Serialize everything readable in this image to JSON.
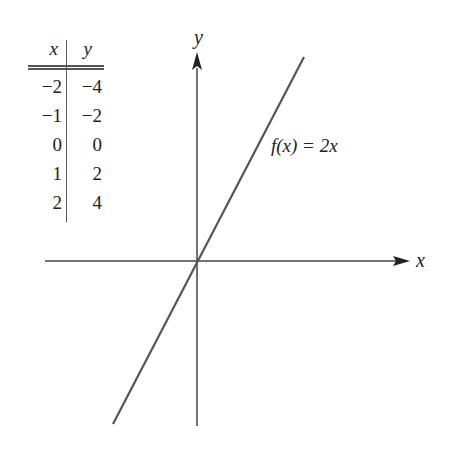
{
  "table": {
    "headers": {
      "x": "x",
      "y": "y"
    },
    "rows": [
      {
        "x": "−2",
        "y": "−4"
      },
      {
        "x": "−1",
        "y": "−2"
      },
      {
        "x": "0",
        "y": "0"
      },
      {
        "x": "1",
        "y": "2"
      },
      {
        "x": "2",
        "y": "4"
      }
    ]
  },
  "axes": {
    "x_label": "x",
    "y_label": "y"
  },
  "function_label": "f(x) = 2x",
  "colors": {
    "line": "#555555",
    "axis": "#444444",
    "text": "#222222"
  }
}
